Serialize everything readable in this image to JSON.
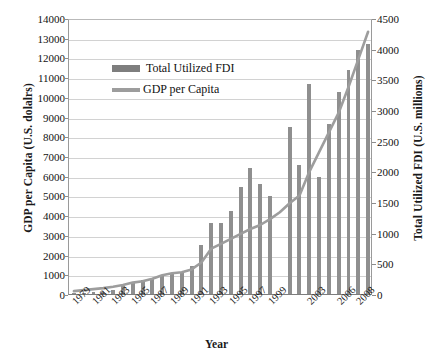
{
  "top_clipped_text": "",
  "axes": {
    "x_title": "Year",
    "y_left_title": "GDP per Capita (U.S. dolalrs)",
    "y_right_title": "Total Utilized FDI (U.S. millions)"
  },
  "legend": {
    "items": [
      {
        "label": "Total Utilized FDI",
        "type": "bar",
        "color": "#7e7e7e"
      },
      {
        "label": "GDP per Capita",
        "type": "line",
        "color": "#9d9d9d"
      }
    ]
  },
  "chart_data": {
    "type": "bar",
    "title": "",
    "xlabel": "Year",
    "grid": true,
    "legend_position": "inside-top-left",
    "categories": [
      "1979",
      "1980",
      "1981",
      "1982",
      "1983",
      "1984",
      "1985",
      "1986",
      "1987",
      "1988",
      "1989",
      "1990",
      "1991",
      "1992",
      "1993",
      "1994",
      "1995",
      "1996",
      "1997",
      "1998",
      "1999",
      "2000",
      "2001",
      "2002",
      "2003",
      "2004",
      "2005",
      "2006",
      "2007",
      "2008",
      "2009"
    ],
    "x_tick_labels": [
      "1979",
      "1981",
      "1983",
      "1985",
      "1987",
      "1989",
      "1991",
      "1993",
      "1995",
      "1997",
      "1999",
      "2003",
      "2006",
      "2008"
    ],
    "series": [
      {
        "name": "Total Utilized FDI",
        "type": "bar",
        "axis": "right",
        "color": "#8f8f8f",
        "ylabel": "Total Utilized FDI (U.S. millions)",
        "ylim": [
          0,
          4500
        ],
        "ytick_labels": [
          "0",
          "500",
          "1000",
          "1500",
          "2000",
          "2500",
          "3000",
          "3500",
          "4000",
          "4500"
        ],
        "values": [
          10,
          20,
          30,
          40,
          60,
          130,
          180,
          230,
          260,
          300,
          320,
          360,
          450,
          800,
          1150,
          1150,
          1350,
          1750,
          2050,
          1800,
          1600,
          null,
          2720,
          2100,
          3430,
          1900,
          2780,
          3300,
          3650,
          3980,
          4080
        ]
      },
      {
        "name": "GDP per Capita",
        "type": "line",
        "axis": "left",
        "color": "#9d9d9d",
        "ylabel": "GDP per Capita (U.S. dolalrs)",
        "ylim": [
          0,
          14000
        ],
        "ytick_labels": [
          "0",
          "1000",
          "2000",
          "3000",
          "4000",
          "5000",
          "6000",
          "7000",
          "8000",
          "9000",
          "10000",
          "11000",
          "12000",
          "13000",
          "14000"
        ],
        "values": [
          250,
          300,
          350,
          400,
          470,
          560,
          680,
          750,
          880,
          1050,
          1150,
          1200,
          1350,
          1700,
          2400,
          2650,
          2900,
          3150,
          3400,
          3600,
          3900,
          4250,
          4700,
          5100,
          6300,
          7300,
          8300,
          9300,
          10600,
          12000,
          13400
        ]
      }
    ]
  }
}
